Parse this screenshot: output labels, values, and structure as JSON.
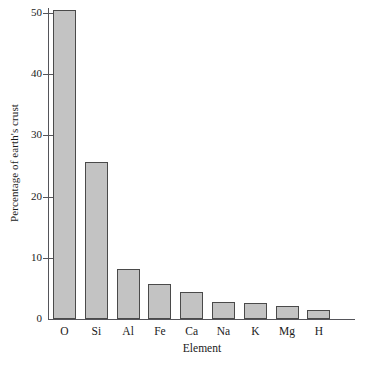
{
  "chart_data": {
    "type": "bar",
    "title": "",
    "subtitle": "",
    "xlabel": "Element",
    "ylabel": "Percentage of earth's crust",
    "categories": [
      "O",
      "Si",
      "Al",
      "Fe",
      "Ca",
      "Na",
      "K",
      "Mg",
      "H"
    ],
    "values": [
      50.5,
      25.7,
      8.1,
      5.8,
      4.4,
      2.8,
      2.6,
      2.1,
      1.5
    ],
    "ylim": [
      0,
      50
    ],
    "yticks": [
      0,
      10,
      20,
      30,
      40,
      50
    ],
    "ytick_labels": [
      "0",
      "10",
      "20",
      "30",
      "40",
      "50"
    ],
    "grid": false,
    "legend": false,
    "legend_position": "none",
    "bar_fill_color": "#c3c3c3",
    "bar_edge_color": "#4a4a4a",
    "axis_color": "#55555a",
    "background_color": "#ffffff"
  }
}
